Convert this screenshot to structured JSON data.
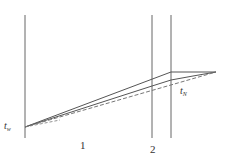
{
  "diagram": {
    "type": "temperature-profile-through-layers",
    "colors": {
      "line": "#555555",
      "dashed": "#666666",
      "background": "#ffffff"
    },
    "boundaries": [
      {
        "name": "wall-left",
        "x": 25
      },
      {
        "name": "layer-boundary",
        "x": 152
      },
      {
        "name": "wall-right",
        "x": 171
      }
    ],
    "labels": {
      "t_w": {
        "base": "t",
        "sub": "w"
      },
      "t_N": {
        "base": "t",
        "sub": "N"
      },
      "region1": "1",
      "region2": "2"
    }
  }
}
